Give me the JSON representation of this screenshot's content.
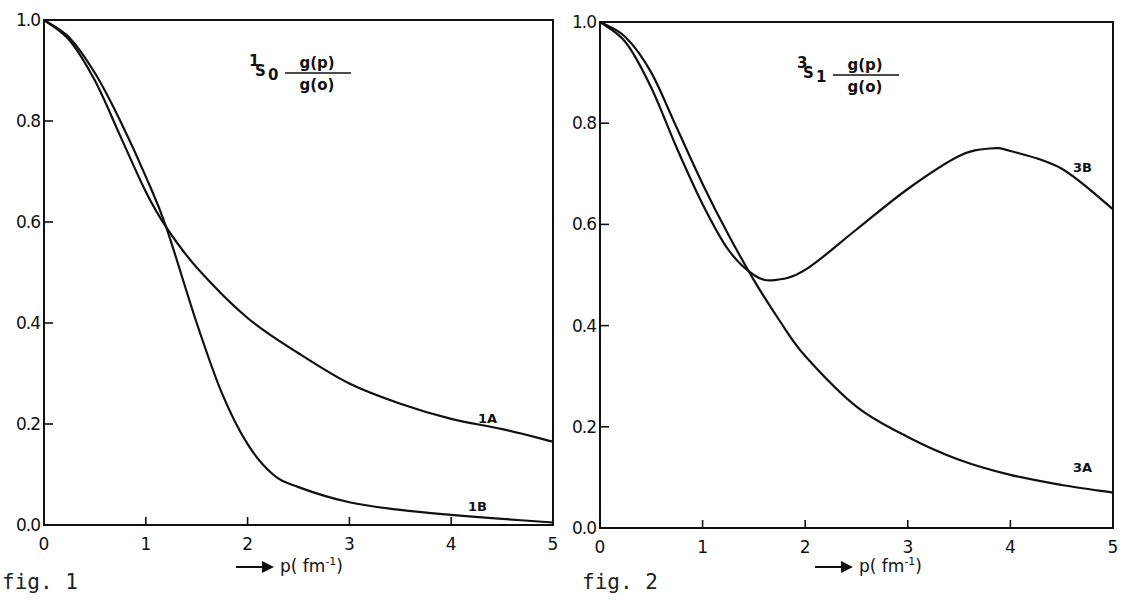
{
  "chart_data": [
    {
      "type": "line",
      "title": "1S0 g(p)/g(o)",
      "title_parts": {
        "superscript": "1",
        "base": "S",
        "subscript": "0",
        "numerator": "g(p)",
        "denominator": "g(o)"
      },
      "caption": "fig. 1",
      "xlabel": "p( fm-1)",
      "xlabel_parts": {
        "arrow": "→",
        "text": "p( fm",
        "sup": "-1",
        "close": ")"
      },
      "ylabel": "",
      "xlim": [
        0,
        5
      ],
      "ylim": [
        0,
        1
      ],
      "x_ticks": [
        "0",
        "1",
        "2",
        "3",
        "4",
        "5"
      ],
      "y_ticks": [
        "0.0",
        "0.2",
        "0.4",
        "0.6",
        "0.8",
        "1.0"
      ],
      "grid": false,
      "series": [
        {
          "name": "1A",
          "x": [
            0,
            0.25,
            0.5,
            0.75,
            1.0,
            1.2,
            1.5,
            2.0,
            2.5,
            3.0,
            3.5,
            4.0,
            4.5,
            5.0
          ],
          "y": [
            1.0,
            0.96,
            0.88,
            0.77,
            0.66,
            0.59,
            0.51,
            0.41,
            0.34,
            0.28,
            0.24,
            0.21,
            0.19,
            0.165
          ]
        },
        {
          "name": "1B",
          "x": [
            0,
            0.25,
            0.5,
            0.75,
            1.0,
            1.2,
            1.5,
            1.75,
            2.0,
            2.25,
            2.5,
            3.0,
            3.5,
            4.0,
            4.5,
            5.0
          ],
          "y": [
            1.0,
            0.965,
            0.895,
            0.8,
            0.69,
            0.59,
            0.4,
            0.26,
            0.16,
            0.1,
            0.075,
            0.045,
            0.03,
            0.02,
            0.012,
            0.005
          ]
        }
      ]
    },
    {
      "type": "line",
      "title": "3S1 g(p)/g(o)",
      "title_parts": {
        "superscript": "3",
        "base": "S",
        "subscript": "1",
        "numerator": "g(p)",
        "denominator": "g(o)"
      },
      "caption": "fig. 2",
      "xlabel": "p( fm-1)",
      "xlabel_parts": {
        "arrow": "→",
        "text": "p( fm",
        "sup": "-1",
        "close": ")"
      },
      "ylabel": "",
      "xlim": [
        0,
        5
      ],
      "ylim": [
        0,
        1
      ],
      "x_ticks": [
        "0",
        "1",
        "2",
        "3",
        "4",
        "5"
      ],
      "y_ticks": [
        "0.0",
        "0.2",
        "0.4",
        "0.6",
        "0.8",
        "1.0"
      ],
      "grid": false,
      "series": [
        {
          "name": "3A",
          "x": [
            0,
            0.25,
            0.5,
            0.75,
            1.0,
            1.25,
            1.5,
            1.75,
            2.0,
            2.5,
            3.0,
            3.5,
            4.0,
            4.5,
            5.0
          ],
          "y": [
            1.0,
            0.97,
            0.9,
            0.79,
            0.68,
            0.58,
            0.49,
            0.41,
            0.34,
            0.24,
            0.18,
            0.135,
            0.105,
            0.085,
            0.07
          ]
        },
        {
          "name": "3B",
          "x": [
            0,
            0.25,
            0.5,
            0.75,
            1.0,
            1.25,
            1.5,
            1.7,
            2.0,
            2.5,
            3.0,
            3.5,
            3.8,
            4.0,
            4.5,
            5.0
          ],
          "y": [
            1.0,
            0.96,
            0.87,
            0.75,
            0.64,
            0.55,
            0.5,
            0.49,
            0.51,
            0.59,
            0.67,
            0.735,
            0.75,
            0.745,
            0.71,
            0.63
          ]
        }
      ]
    }
  ],
  "figures": {
    "fig1": {
      "caption": "fig. 1",
      "labels": {
        "a": "1A",
        "b": "1B"
      }
    },
    "fig2": {
      "caption": "fig. 2",
      "labels": {
        "a": "3A",
        "b": "3B"
      }
    }
  },
  "layout": {
    "panels": [
      {
        "left": 44,
        "right": 553,
        "top": 20,
        "bottom": 525,
        "title_x": 255,
        "title_y": 70,
        "label_pos": [
          {
            "x": 478,
            "y": 423
          },
          {
            "x": 468,
            "y": 511
          }
        ],
        "caption_x": 2,
        "caption_y": 567,
        "xlabel_x": 236,
        "xlabel_y": 572
      },
      {
        "left": 600,
        "right": 1113,
        "top": 22,
        "bottom": 528,
        "title_x": 803,
        "title_y": 72,
        "label_pos": [
          {
            "x": 1073,
            "y": 472
          },
          {
            "x": 1073,
            "y": 172
          }
        ],
        "caption_x": 582,
        "caption_y": 567,
        "xlabel_x": 815,
        "xlabel_y": 572
      }
    ],
    "line_color": "#111111"
  }
}
